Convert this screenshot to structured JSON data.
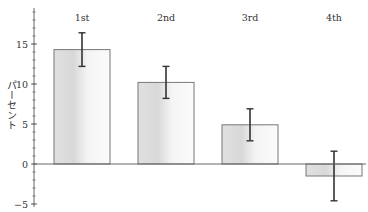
{
  "chart_data": {
    "type": "bar",
    "title": "",
    "xlabel": "",
    "ylabel": "パーセント",
    "categories": [
      "1st",
      "2nd",
      "3rd",
      "4th"
    ],
    "values": [
      14.3,
      10.2,
      4.9,
      -1.5
    ],
    "error": [
      2.1,
      2.0,
      2.0,
      3.1
    ],
    "ylim": [
      -5,
      19
    ],
    "yticks": [
      -5,
      0,
      5,
      10,
      15
    ],
    "minor_tick_step": 1,
    "grid": false,
    "legend": null,
    "category_label_position": "top",
    "colors": {
      "bar_fill_dark": "#e2e2e2",
      "bar_fill_light": "#fafafa",
      "bar_edge": "#777777",
      "error_bar": "#333333",
      "axis": "#666666",
      "text": "#333333"
    }
  }
}
